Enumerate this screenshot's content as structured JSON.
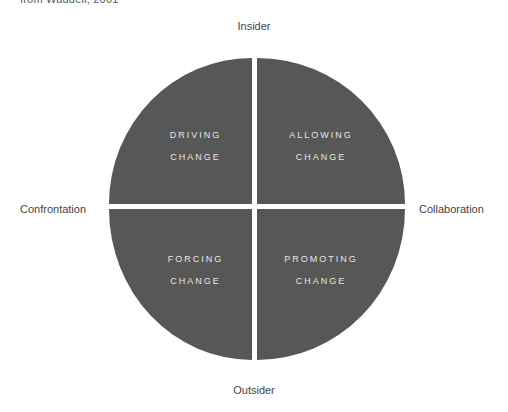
{
  "caption": "from Waddell, 2001",
  "axes": {
    "top": "Insider",
    "bottom": "Outsider",
    "left": "Confrontation",
    "right": "Collaboration"
  },
  "quadrants": {
    "top_left": {
      "line1": "DRIVING",
      "line2": "CHANGE"
    },
    "top_right": {
      "line1": "ALLOWING",
      "line2": "CHANGE"
    },
    "bottom_left": {
      "line1": "FORCING",
      "line2": "CHANGE"
    },
    "bottom_right": {
      "line1": "PROMOTING",
      "line2": "CHANGE"
    }
  },
  "colors": {
    "quadrant_fill": "#575757",
    "quadrant_text": "#e6e6e6",
    "background": "#ffffff"
  }
}
